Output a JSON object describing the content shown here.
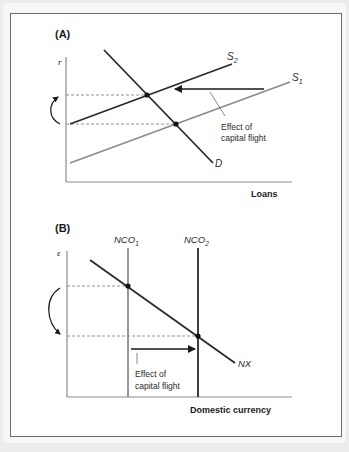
{
  "figure": {
    "panel_a": {
      "label": "(A)",
      "y_axis_label": "r",
      "x_axis_label": "Loans",
      "curves": {
        "s2": {
          "label": "S",
          "sub": "2"
        },
        "s1": {
          "label": "S",
          "sub": "1"
        },
        "d": {
          "label": "D"
        }
      },
      "annotation_line1": "Effect of",
      "annotation_line2": "capital flight"
    },
    "panel_b": {
      "label": "(B)",
      "y_axis_label": "ε",
      "x_axis_label": "Domestic currency",
      "curves": {
        "nco1": {
          "label": "NCO",
          "sub": "1"
        },
        "nco2": {
          "label": "NCO",
          "sub": "2"
        },
        "nx": {
          "label": "NX"
        }
      },
      "annotation_line1": "Effect of",
      "annotation_line2": "capital flight"
    },
    "colors": {
      "dark_line": "#2a2a2a",
      "gray_line": "#8c8c8c",
      "frame": "#6e6e6e",
      "background": "#ececec"
    }
  }
}
